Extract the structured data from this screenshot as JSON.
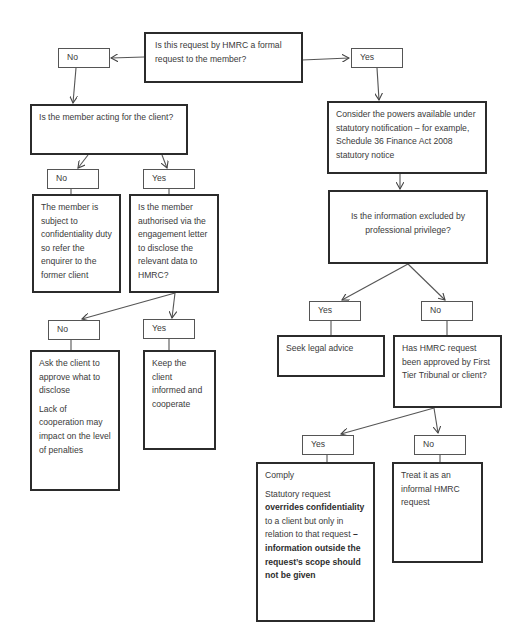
{
  "diagram": {
    "type": "flowchart",
    "nodes": {
      "q_formal": {
        "text": "Is this request by HMRC a formal request to the member?"
      },
      "lbl_formal_no": {
        "text": "No"
      },
      "lbl_formal_yes": {
        "text": "Yes"
      },
      "q_acting": {
        "text": "Is the member acting for the client?"
      },
      "lbl_acting_no": {
        "text": "No"
      },
      "lbl_acting_yes": {
        "text": "Yes"
      },
      "a_confidential": {
        "text": "The member is subject to confidentiality duty so refer the enquirer to the former client"
      },
      "q_authorised": {
        "text": "Is the member authorised via the engagement letter to disclose the relevant data to HMRC?"
      },
      "lbl_auth_no": {
        "text": "No"
      },
      "lbl_auth_yes": {
        "text": "Yes"
      },
      "a_ask_client": {
        "p1": "Ask the client to approve what to disclose",
        "p2": "Lack of cooperation may impact on the level of penalties"
      },
      "a_keep_informed": {
        "text": "Keep the client informed and cooperate"
      },
      "a_consider_powers": {
        "text": "Consider the powers available under statutory notification – for example, Schedule 36 Finance Act 2008 statutory notice"
      },
      "q_privilege": {
        "text": "Is the information excluded by professional privilege?"
      },
      "lbl_priv_yes": {
        "text": "Yes"
      },
      "lbl_priv_no": {
        "text": "No"
      },
      "a_legal_advice": {
        "text": "Seek legal advice"
      },
      "q_approved": {
        "text": "Has HMRC request been approved by First Tier Tribunal or client?"
      },
      "lbl_appr_yes": {
        "text": "Yes"
      },
      "lbl_appr_no": {
        "text": "No"
      },
      "a_comply": {
        "title": "Comply",
        "t1": "Statutory request ",
        "b1": "overrides confidentiality",
        "t2": " to a client but only in relation to that request ",
        "b2": "– information outside the request’s scope should not be given"
      },
      "a_informal": {
        "text": "Treat it as an informal HMRC request"
      }
    },
    "colors": {
      "border": "#2b2b2b",
      "text": "#3a3a3a",
      "background": "#ffffff"
    }
  }
}
